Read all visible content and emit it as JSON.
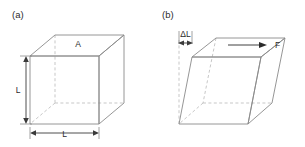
{
  "figure": {
    "background_color": "#ffffff",
    "edge_color": "#8a8a8a",
    "hidden_edge_color": "#b9b9b9",
    "dimension_color": "#3a3a3a",
    "text_color": "#2b2b2b"
  },
  "panel_a": {
    "label": "(a)",
    "area_label": "A",
    "height_label": "L",
    "width_label": "L",
    "description": "undeformed cube"
  },
  "panel_b": {
    "label": "(b)",
    "displacement_label": "ΔL",
    "force_label": "F",
    "description": "sheared cube under applied force"
  }
}
